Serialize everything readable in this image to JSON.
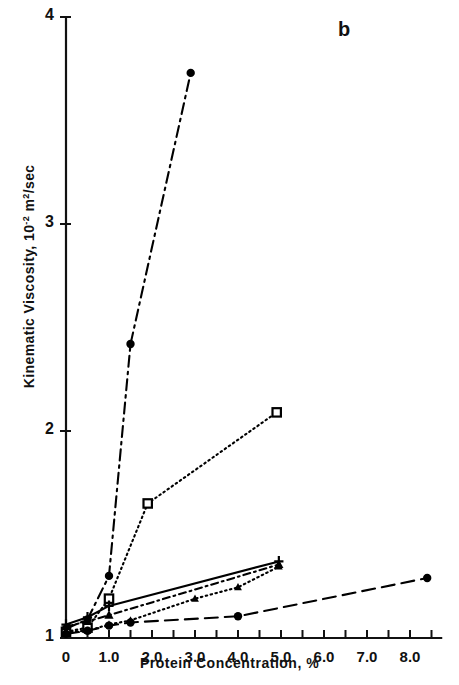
{
  "panel": {
    "label": "b"
  },
  "chart_data": {
    "type": "line",
    "title": "",
    "xlabel": "Protein Concentration, %",
    "ylabel": "Kinematic Viscosity, 10-2 m2/sec",
    "ylabel_parts": {
      "pre": "Kinematic Viscosity, 10",
      "sup1": "-2",
      "mid": " m",
      "sup2": "2",
      "post": "/sec"
    },
    "xlim": [
      0,
      8.75
    ],
    "ylim": [
      1,
      4
    ],
    "xticks_major": [
      0,
      1.0,
      2.0,
      3.0,
      4.0,
      5.0,
      6.0,
      7.0,
      8.0
    ],
    "xtick_labels": [
      "0",
      "1.0",
      "2.0",
      "3.0",
      "4.0",
      "5.0",
      "6.0",
      "7.0",
      "8.0"
    ],
    "xticks_minor": [
      0.5,
      1.5,
      2.5,
      3.5,
      4.5,
      5.5,
      6.5,
      7.5,
      8.5
    ],
    "yticks": [
      1,
      2,
      3,
      4
    ],
    "ytick_labels": [
      "1",
      "2",
      "3",
      "4"
    ],
    "grid": false,
    "legend": "none",
    "series": [
      {
        "name": "series-dashdot-circle",
        "linestyle": "dashdot",
        "marker": "filled-circle",
        "color": "#000000",
        "points": [
          {
            "x": 0.0,
            "y": 1.045
          },
          {
            "x": 0.5,
            "y": 1.09
          },
          {
            "x": 1.0,
            "y": 1.3
          },
          {
            "x": 1.5,
            "y": 2.42
          },
          {
            "x": 2.9,
            "y": 3.73
          }
        ]
      },
      {
        "name": "series-dotted-square",
        "linestyle": "dotted",
        "marker": "open-square",
        "color": "#000000",
        "points": [
          {
            "x": 0.0,
            "y": 1.03
          },
          {
            "x": 0.5,
            "y": 1.05
          },
          {
            "x": 1.0,
            "y": 1.19
          },
          {
            "x": 1.9,
            "y": 1.65
          },
          {
            "x": 4.9,
            "y": 2.09
          }
        ]
      },
      {
        "name": "series-solid-cross",
        "linestyle": "solid",
        "marker": "cross",
        "color": "#000000",
        "points": [
          {
            "x": 0.0,
            "y": 1.065
          },
          {
            "x": 0.5,
            "y": 1.1
          },
          {
            "x": 1.0,
            "y": 1.155
          },
          {
            "x": 4.95,
            "y": 1.37
          }
        ]
      },
      {
        "name": "series-dashdot-triangle",
        "linestyle": "dashdot-short",
        "marker": "filled-triangle",
        "color": "#000000",
        "points": [
          {
            "x": 0.0,
            "y": 1.055
          },
          {
            "x": 0.5,
            "y": 1.08
          },
          {
            "x": 1.0,
            "y": 1.11
          },
          {
            "x": 4.95,
            "y": 1.355
          }
        ]
      },
      {
        "name": "series-dotted-triangle",
        "linestyle": "dotted",
        "marker": "filled-triangle-small",
        "color": "#000000",
        "points": [
          {
            "x": 0.0,
            "y": 1.03
          },
          {
            "x": 0.5,
            "y": 1.035
          },
          {
            "x": 1.0,
            "y": 1.065
          },
          {
            "x": 1.5,
            "y": 1.085
          },
          {
            "x": 3.0,
            "y": 1.19
          },
          {
            "x": 4.0,
            "y": 1.245
          },
          {
            "x": 4.95,
            "y": 1.345
          }
        ]
      },
      {
        "name": "series-longdash-circle",
        "linestyle": "longdash",
        "marker": "filled-circle",
        "color": "#000000",
        "points": [
          {
            "x": 0.0,
            "y": 1.02
          },
          {
            "x": 0.5,
            "y": 1.035
          },
          {
            "x": 1.0,
            "y": 1.06
          },
          {
            "x": 1.5,
            "y": 1.075
          },
          {
            "x": 4.0,
            "y": 1.105
          },
          {
            "x": 8.4,
            "y": 1.29
          }
        ]
      }
    ]
  }
}
